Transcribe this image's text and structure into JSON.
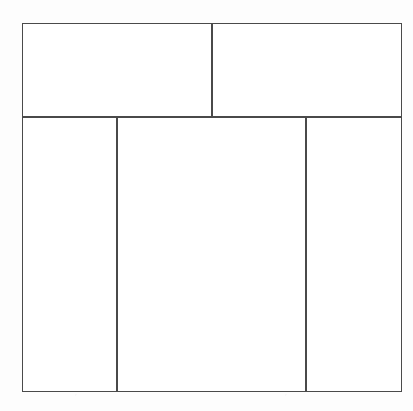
{
  "page": {
    "canvas_width": 413,
    "canvas_height": 411,
    "background_color": "#fdfdfd"
  },
  "figure": {
    "line_color": "#4a4a4a",
    "line_width_px": 1.5,
    "fill_color": "#ffffff",
    "outer_rect": {
      "x": 22,
      "y": 23,
      "width": 380,
      "height": 369
    }
  },
  "rows": [
    {
      "name": "top-row",
      "y": 23,
      "height": 93,
      "cells": [
        {
          "id": "top-left",
          "label": "",
          "x": 22,
          "y": 23,
          "width": 189,
          "height": 93
        },
        {
          "id": "top-right",
          "label": "",
          "x": 211,
          "y": 23,
          "width": 191,
          "height": 93
        }
      ]
    },
    {
      "name": "bottom-row",
      "y": 116,
      "height": 276,
      "cells": [
        {
          "id": "bottom-left",
          "label": "",
          "x": 22,
          "y": 116,
          "width": 94,
          "height": 276
        },
        {
          "id": "bottom-center",
          "label": "",
          "x": 116,
          "y": 116,
          "width": 189,
          "height": 276
        },
        {
          "id": "bottom-right",
          "label": "",
          "x": 305,
          "y": 116,
          "width": 97,
          "height": 276
        }
      ]
    }
  ],
  "dividers": [
    {
      "id": "divider-horizontal-main",
      "orientation": "horizontal",
      "x": 22,
      "y": 116,
      "length": 380
    },
    {
      "id": "divider-vertical-top",
      "orientation": "vertical",
      "x": 211,
      "y": 23,
      "length": 93
    },
    {
      "id": "divider-vertical-left",
      "orientation": "vertical",
      "x": 116,
      "y": 116,
      "length": 276
    },
    {
      "id": "divider-vertical-right",
      "orientation": "vertical",
      "x": 305,
      "y": 116,
      "length": 276
    }
  ]
}
